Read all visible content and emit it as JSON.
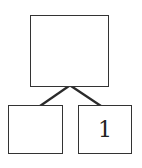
{
  "tree": {
    "root": {
      "label": ""
    },
    "children": [
      {
        "label": ""
      },
      {
        "label": "1"
      }
    ]
  },
  "colors": {
    "stroke": "#333333",
    "edge": "#2a2a2a",
    "background": "#ffffff"
  }
}
